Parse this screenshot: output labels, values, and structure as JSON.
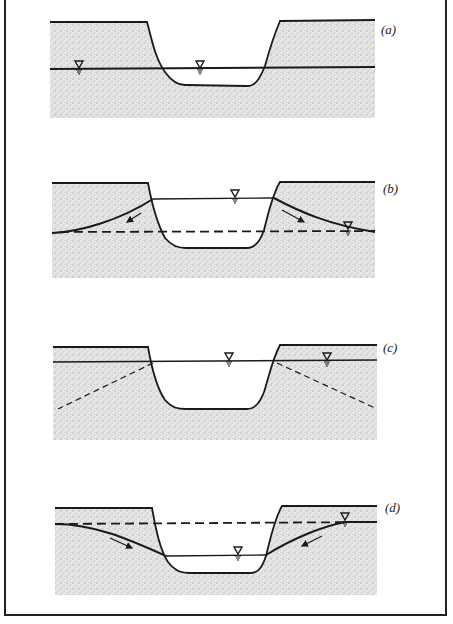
{
  "figure": {
    "panels": [
      {
        "id": "a",
        "label": "(a)",
        "description": "Water table level with stream surface; ground surface above"
      },
      {
        "id": "b",
        "label": "(b)",
        "description": "Stream stage above regional water table; flow from stream into banks (losing stream)"
      },
      {
        "id": "c",
        "label": "(c)",
        "description": "Water table coincides with elevated stream stage; dashed lines show former water-table slopes"
      },
      {
        "id": "d",
        "label": "(d)",
        "description": "Bank storage returns to stream as stage falls; flow toward stream (gaining stream)"
      }
    ],
    "symbols": {
      "water_level": "inverted-triangle with hatch lines"
    },
    "colors": {
      "line": "#1a1a1a",
      "stipple": "#bdbdbd",
      "background": "#ffffff"
    },
    "caption_fragment": ""
  }
}
